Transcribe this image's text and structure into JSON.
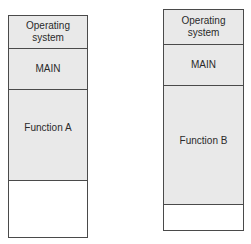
{
  "diagram": {
    "left_column": {
      "segments": [
        {
          "label_line1": "Operating",
          "label_line2": "system",
          "shaded": true
        },
        {
          "label": "MAIN",
          "shaded": true
        },
        {
          "label": "Function A",
          "shaded": true
        },
        {
          "label": "",
          "shaded": false
        }
      ]
    },
    "right_column": {
      "segments": [
        {
          "label_line1": "Operating",
          "label_line2": "system",
          "shaded": true
        },
        {
          "label": "MAIN",
          "shaded": true
        },
        {
          "label": "Function B",
          "shaded": true
        },
        {
          "label": "",
          "shaded": false
        }
      ]
    }
  }
}
